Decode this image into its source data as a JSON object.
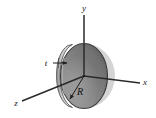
{
  "figure": {
    "kind": "3d-coordinate-diagram",
    "caption_text": "",
    "background_color": "#ffffff",
    "axes": [
      {
        "id": "x",
        "label": "x",
        "direction": "right",
        "label_x": 145,
        "label_y": 85
      },
      {
        "id": "y",
        "label": "y",
        "direction": "up",
        "label_x": 84,
        "label_y": 11
      },
      {
        "id": "z",
        "label": "z",
        "direction": "lower-left",
        "label_x": 16,
        "label_y": 106
      }
    ],
    "object": {
      "name": "disk",
      "shape": "cylinder",
      "orientation": "face-in-xy-plane",
      "center": "origin",
      "fill_dark": "#6e6e6e",
      "fill_mid": "#8c8c8c",
      "fill_light": "#b4b4b4",
      "rim_color": "#d0d0d0",
      "outline_color": "#3a3a3a"
    },
    "annotations": [
      {
        "id": "thickness",
        "label": "t",
        "label_x": 46,
        "label_y": 65,
        "leader": "arrow-right-to-rim",
        "describes": "disk thickness"
      },
      {
        "id": "radius",
        "label": "R",
        "label_x": 80,
        "label_y": 92,
        "leader": "arrow-down-left-from-origin",
        "describes": "disk radius"
      }
    ],
    "colors": {
      "line": "#2a2a2a",
      "text": "#141414",
      "disk_dark": "#6e6e6e",
      "disk_light": "#b8b8b8",
      "rim": "#d4d4d4"
    }
  }
}
